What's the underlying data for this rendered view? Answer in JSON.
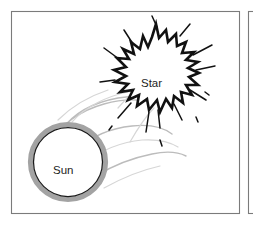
{
  "figure": {
    "background_color": "#ffffff",
    "panels": [
      {
        "name": "main-panel",
        "x": 11,
        "y": 11,
        "width": 228,
        "height": 203,
        "border_color": "#7b7b7b"
      },
      {
        "name": "adjacent-panel-edge",
        "x": 248,
        "y": 11,
        "width": 40,
        "height": 203,
        "border_color": "#7b7b7b"
      }
    ]
  },
  "labels": {
    "sun": "Sun",
    "star": "Star"
  },
  "objects": {
    "sun": {
      "label": "Sun",
      "center_x": 68,
      "center_y": 162,
      "radius": 35,
      "ring_color": "#a3a3a3",
      "outline_color": "#1a1a1a",
      "fill_color": "#ffffff",
      "label_x": 66,
      "label_y": 171
    },
    "star": {
      "label": "Star",
      "center_x": 152,
      "center_y": 82,
      "radius": 45,
      "outline_color": "#111111",
      "fill_color": "#ffffff",
      "label_x": 152,
      "label_y": 84
    },
    "flares": {
      "name": "solar-flare-streams",
      "color": "#bcbcbc",
      "count": 9
    }
  },
  "colors": {
    "panel_border": "#7b7b7b",
    "ink": "#111111",
    "gray_ring": "#a3a3a3",
    "flare_gray": "#bcbcbc",
    "flare_light": "#d6d6d6",
    "paper": "#ffffff"
  }
}
